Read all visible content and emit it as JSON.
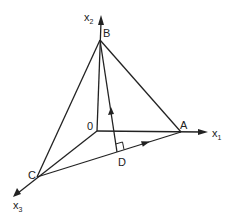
{
  "diagram": {
    "type": "3d-coordinate-geometry",
    "axes": [
      {
        "name": "x1",
        "label": "x",
        "subscript": "1"
      },
      {
        "name": "x2",
        "label": "x",
        "subscript": "2"
      },
      {
        "name": "x3",
        "label": "x",
        "subscript": "3"
      }
    ],
    "points": {
      "origin": {
        "label": "0"
      },
      "A": {
        "label": "A"
      },
      "B": {
        "label": "B"
      },
      "C": {
        "label": "C"
      },
      "D": {
        "label": "D"
      }
    },
    "edges": [
      "O-A",
      "O-B",
      "O-C",
      "A-B",
      "B-C",
      "C-A",
      "D-B"
    ],
    "annotations": {
      "right_angle_at": "D",
      "arrow_on_CA": "toward A",
      "arrow_on_DB": "toward B"
    },
    "colors": {
      "stroke": "#222222",
      "background": "#ffffff"
    }
  }
}
